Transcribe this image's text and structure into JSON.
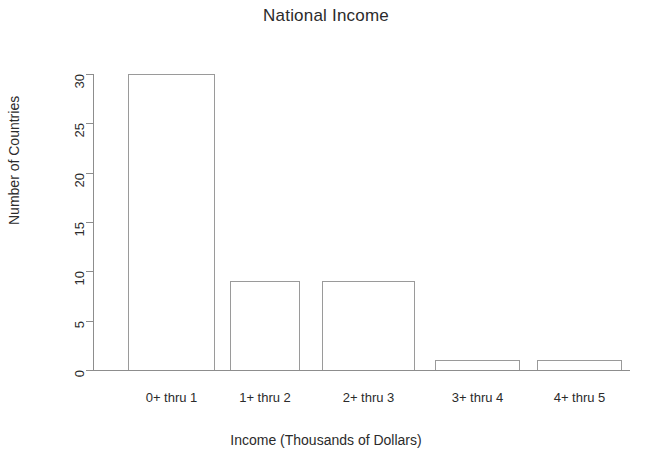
{
  "chart_data": {
    "type": "bar",
    "title": "National Income",
    "xlabel": "Income (Thousands of Dollars)",
    "ylabel": "Number of Countries",
    "categories": [
      "0+ thru 1",
      "1+ thru 2",
      "2+ thru 3",
      "3+ thru 4",
      "4+ thru 5"
    ],
    "values": [
      30,
      9,
      9,
      1,
      1
    ],
    "ylim": [
      0,
      30
    ],
    "yticks": [
      0,
      5,
      10,
      15,
      20,
      25,
      30
    ],
    "ytick_labels": [
      "0",
      "5",
      "10",
      "15",
      "20",
      "25",
      "30"
    ],
    "grid": false,
    "legend": false,
    "bar_fill": "#ffffff",
    "bar_border": "#9a9a9a",
    "axis_color": "#8d8d8d",
    "text_color": "#2b2b2b",
    "background": "#ffffff"
  }
}
